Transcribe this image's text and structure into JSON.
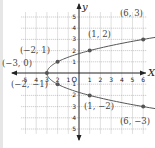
{
  "chart_data": {
    "type": "line",
    "title": "",
    "xlabel": "x",
    "ylabel": "y",
    "origin_label": "O",
    "xlim": [
      -5,
      6
    ],
    "ylim": [
      -5,
      5
    ],
    "x_ticks": [
      -5,
      -4,
      -3,
      -2,
      -1,
      1,
      2,
      3,
      4,
      5,
      6
    ],
    "y_ticks": [
      -5,
      -4,
      -3,
      -2,
      -1,
      1,
      2,
      3,
      4,
      5
    ],
    "x_tick_labels": [
      "5",
      "4",
      "3",
      "2",
      "1",
      "1",
      "2",
      "3",
      "4",
      "5",
      "6"
    ],
    "y_tick_labels": [
      "5",
      "4",
      "3",
      "2",
      "1",
      "1",
      "2",
      "3",
      "4",
      "5"
    ],
    "grid": true,
    "series": [
      {
        "name": "x = y^2 - 3",
        "x": [
          -3,
          -2,
          1,
          6,
          -2,
          1,
          6
        ],
        "y": [
          0,
          1,
          2,
          3,
          -1,
          -2,
          -3
        ]
      }
    ],
    "points": [
      {
        "x": -3,
        "y": 0,
        "label": "(−3, 0)"
      },
      {
        "x": -2,
        "y": 1,
        "label": "(−2, 1)"
      },
      {
        "x": 1,
        "y": 2,
        "label": "(1, 2)"
      },
      {
        "x": 6,
        "y": 3,
        "label": "(6, 3)"
      },
      {
        "x": -2,
        "y": -1,
        "label": "(−2, −1)"
      },
      {
        "x": 1,
        "y": -2,
        "label": "(1, −2)"
      },
      {
        "x": 6,
        "y": -3,
        "label": "(6, −3)"
      }
    ],
    "colors": {
      "axis": "#222222",
      "grid": "#9a9a9a",
      "curve": "#555555",
      "point": "#555555",
      "label": "#444444"
    }
  }
}
